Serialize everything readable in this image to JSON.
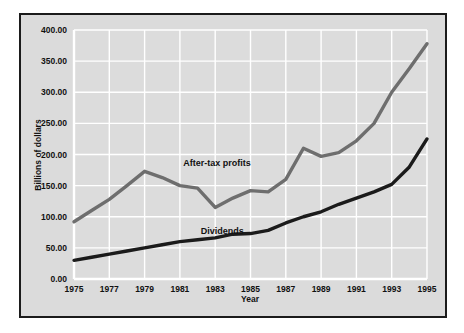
{
  "chart_data": {
    "type": "line",
    "title": "",
    "xlabel": "Year",
    "ylabel": "Billions of dollars",
    "xlim": [
      1975,
      1995
    ],
    "ylim": [
      0,
      400
    ],
    "grid": true,
    "legend": "inline-annotations",
    "x": [
      1975,
      1976,
      1977,
      1978,
      1979,
      1980,
      1981,
      1982,
      1983,
      1984,
      1985,
      1986,
      1987,
      1988,
      1989,
      1990,
      1991,
      1992,
      1993,
      1994,
      1995
    ],
    "xtick_labels": [
      "1975",
      "1977",
      "1979",
      "1981",
      "1983",
      "1985",
      "1987",
      "1989",
      "1991",
      "1993",
      "1995"
    ],
    "xtick_values": [
      1975,
      1977,
      1979,
      1981,
      1983,
      1985,
      1987,
      1989,
      1991,
      1993,
      1995
    ],
    "ytick_labels": [
      "0.00",
      "50.00",
      "100.00",
      "150.00",
      "200.00",
      "250.00",
      "300.00",
      "350.00",
      "400.00"
    ],
    "ytick_values": [
      0,
      50,
      100,
      150,
      200,
      250,
      300,
      350,
      400
    ],
    "series": [
      {
        "name": "After-tax profits",
        "color": "#6e6e6e",
        "label_x": 1983.1,
        "label_y": 182,
        "values": [
          92,
          110,
          128,
          150,
          173,
          163,
          150,
          146,
          115,
          130,
          142,
          140,
          160,
          210,
          197,
          203,
          222,
          250,
          300,
          338,
          378
        ]
      },
      {
        "name": "Dividends",
        "color": "#1b1b1b",
        "label_x": 1983.4,
        "label_y": 72,
        "values": [
          30,
          35,
          40,
          45,
          50,
          55,
          60,
          63,
          66,
          72,
          73,
          78,
          90,
          100,
          108,
          120,
          130,
          140,
          152,
          180,
          225
        ]
      }
    ]
  },
  "figure": {
    "border_color": "#1b1b1b",
    "panel_color": "#dbdbdb",
    "plot_bg_color": "#dcdcdc",
    "gridline_color": "#ffffff",
    "axis_color": "#ffffff"
  }
}
